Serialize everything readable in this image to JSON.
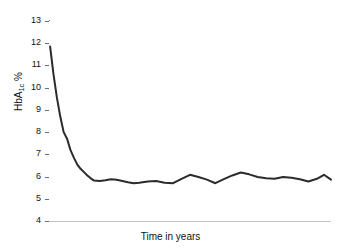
{
  "chart_data": {
    "type": "line",
    "title": "",
    "subtitle": "",
    "xlabel": "Time in years",
    "ylabel_prefix": "HbA",
    "ylabel_sub": "1c",
    "ylabel_suffix": " %",
    "ylabel_full": "HbA1c %",
    "grid": "horizontal",
    "legend": "none",
    "ylim": [
      4,
      13
    ],
    "ytick_labels": [
      "13",
      "12",
      "11",
      "10",
      "9",
      "8",
      "7",
      "6",
      "5",
      "4"
    ],
    "yticks": [
      13,
      12,
      11,
      10,
      9,
      8,
      7,
      6,
      5,
      4
    ],
    "xlim": [
      0,
      100
    ],
    "xtick_labels": [],
    "series": [
      {
        "name": "HbA1c",
        "color": "#2b2b2b",
        "x": [
          0.4,
          1.6,
          2.8,
          4.0,
          5.2,
          6.4,
          7.6,
          8.8,
          10.0,
          11.2,
          12.4,
          13.6,
          14.8,
          16.0,
          18.0,
          20.0,
          22.0,
          24.0,
          26.0,
          28.0,
          30.0,
          32.0,
          35.0,
          38.0,
          41.0,
          44.0,
          47.0,
          50.0,
          53.0,
          56.0,
          59.0,
          62.0,
          65.0,
          68.0,
          71.0,
          74.0,
          77.0,
          80.0,
          83.0,
          86.0,
          89.0,
          92.0,
          95.0,
          97.5,
          100.0
        ],
        "values": [
          11.85,
          10.6,
          9.55,
          8.7,
          8.0,
          7.7,
          7.2,
          6.85,
          6.55,
          6.35,
          6.2,
          6.05,
          5.92,
          5.82,
          5.8,
          5.83,
          5.88,
          5.86,
          5.8,
          5.74,
          5.7,
          5.72,
          5.78,
          5.8,
          5.72,
          5.7,
          5.9,
          6.08,
          5.98,
          5.86,
          5.7,
          5.88,
          6.05,
          6.18,
          6.1,
          5.98,
          5.92,
          5.9,
          5.98,
          5.95,
          5.88,
          5.78,
          5.9,
          6.08,
          5.86
        ]
      }
    ]
  }
}
